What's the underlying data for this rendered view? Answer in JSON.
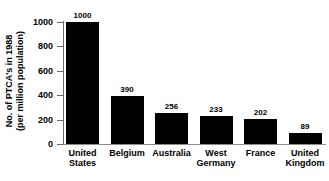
{
  "chart_data": {
    "type": "bar",
    "title": "",
    "xlabel": "",
    "ylabel": "No. of PTCA's in 1988 (per million population)",
    "ylabel_line1": "No. of PTCA's in 1988",
    "ylabel_line2": "(per million population)",
    "categories": [
      "United States",
      "Belgium",
      "Australia",
      "West Germany",
      "France",
      "United Kingdom"
    ],
    "category_lines": [
      [
        "United",
        "States"
      ],
      [
        "Belgium"
      ],
      [
        "Australia"
      ],
      [
        "West",
        "Germany"
      ],
      [
        "France"
      ],
      [
        "United",
        "Kingdom"
      ]
    ],
    "values": [
      1000,
      390,
      256,
      233,
      202,
      89
    ],
    "value_labels": [
      "1000",
      "390",
      "256",
      "233",
      "202",
      "89"
    ],
    "ylim": [
      0,
      1000
    ],
    "yticks": [
      0,
      200,
      400,
      600,
      800,
      1000
    ],
    "ytick_labels": [
      "0",
      "200",
      "400",
      "600",
      "800",
      "1000"
    ],
    "grid": false,
    "legend": false,
    "bar_color": "#000000",
    "axis_color": "#6b6b6b",
    "text_color": "#000000",
    "background": "#ffffff"
  }
}
